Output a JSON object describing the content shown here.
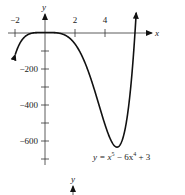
{
  "chart_data": [
    {
      "type": "line",
      "title": "",
      "xlabel": "x",
      "ylabel": "y",
      "annotation": "y = x^5 - 6x^4 + 3",
      "annotation_parts": {
        "lhs": "y = x",
        "exp1": "5",
        "mid": " − 6x",
        "exp2": "4",
        "rhs": " + 3"
      },
      "function": "x^5 - 6x^4 + 3",
      "xlim": [
        -2.1,
        6.1
      ],
      "ylim": [
        -700,
        80
      ],
      "x_ticks": [
        -2,
        0,
        2,
        4
      ],
      "x_tick_labels": [
        "−2",
        "2",
        "4"
      ],
      "x_tick_label_values": [
        -2,
        2,
        4
      ],
      "y_ticks": [
        -100,
        -200,
        -300,
        -400,
        -500,
        -600,
        -700
      ],
      "y_tick_labels": [
        "−200",
        "−400",
        "−600"
      ],
      "y_tick_label_values": [
        -200,
        -400,
        -600
      ],
      "grid": false,
      "legend": null,
      "points": [
        {
          "x": -2,
          "y": -125
        },
        {
          "x": -1.5,
          "y": -34
        },
        {
          "x": -1,
          "y": -4
        },
        {
          "x": 0,
          "y": 3
        },
        {
          "x": 1,
          "y": -2
        },
        {
          "x": 2,
          "y": -61
        },
        {
          "x": 3,
          "y": -240
        },
        {
          "x": 4,
          "y": -509
        },
        {
          "x": 4.8,
          "y": -634
        },
        {
          "x": 5,
          "y": -622
        },
        {
          "x": 5.5,
          "y": -434
        },
        {
          "x": 6,
          "y": 3
        }
      ],
      "color": "#111111"
    },
    {
      "type": "line",
      "partial": true,
      "ylabel": "y"
    }
  ]
}
